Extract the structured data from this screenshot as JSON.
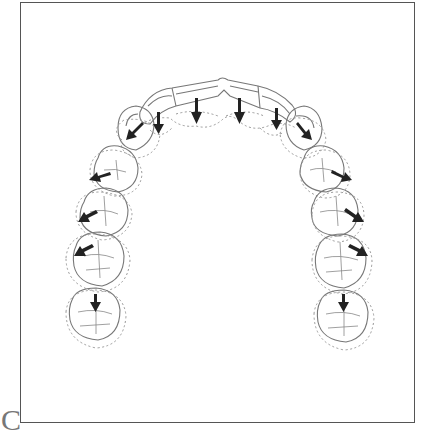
{
  "figure": {
    "panel_label": "C",
    "colors": {
      "outline": "#777777",
      "dashed": "#999999",
      "arrow": "#222222",
      "frame": "#555555"
    }
  },
  "teeth": {
    "incisors": [
      {
        "name": "right-lateral-incisor",
        "cx": 152,
        "cy": 110,
        "arrow": {
          "x": 158,
          "y": 118,
          "angle": 180
        }
      },
      {
        "name": "right-central-incisor",
        "cx": 196,
        "cy": 96,
        "arrow": {
          "x": 196,
          "y": 100,
          "angle": 180
        }
      },
      {
        "name": "left-central-incisor",
        "cx": 239,
        "cy": 96,
        "arrow": {
          "x": 239,
          "y": 100,
          "angle": 180
        }
      },
      {
        "name": "left-lateral-incisor",
        "cx": 276,
        "cy": 110,
        "arrow": {
          "x": 276,
          "y": 113,
          "angle": 180
        }
      }
    ],
    "right_side": [
      {
        "name": "right-canine",
        "cx": 134,
        "cy": 131,
        "arrow": {
          "x": 132,
          "y": 132,
          "angle": 210
        }
      },
      {
        "name": "right-first-premolar",
        "cx": 114,
        "cy": 169,
        "arrow": {
          "x": 98,
          "y": 176,
          "angle": 245
        }
      },
      {
        "name": "right-second-premolar",
        "cx": 102,
        "cy": 212,
        "arrow": {
          "x": 83,
          "y": 214,
          "angle": 235
        }
      },
      {
        "name": "right-first-molar",
        "cx": 96,
        "cy": 257,
        "arrow": {
          "x": 79,
          "y": 250,
          "angle": 240
        }
      },
      {
        "name": "right-second-molar",
        "cx": 96,
        "cy": 313,
        "arrow": {
          "x": 95,
          "y": 300,
          "angle": 180
        }
      }
    ],
    "left_side": [
      {
        "name": "left-canine",
        "cx": 303,
        "cy": 131,
        "arrow": {
          "x": 303,
          "y": 132,
          "angle": 145
        }
      },
      {
        "name": "left-first-premolar",
        "cx": 325,
        "cy": 169,
        "arrow": {
          "x": 342,
          "y": 178,
          "angle": 120
        }
      },
      {
        "name": "left-second-premolar",
        "cx": 336,
        "cy": 212,
        "arrow": {
          "x": 356,
          "y": 217,
          "angle": 125
        }
      },
      {
        "name": "left-first-molar",
        "cx": 341,
        "cy": 260,
        "arrow": {
          "x": 360,
          "y": 250,
          "angle": 120
        }
      },
      {
        "name": "left-second-molar",
        "cx": 343,
        "cy": 315,
        "arrow": {
          "x": 344,
          "y": 300,
          "angle": 180
        }
      }
    ]
  }
}
